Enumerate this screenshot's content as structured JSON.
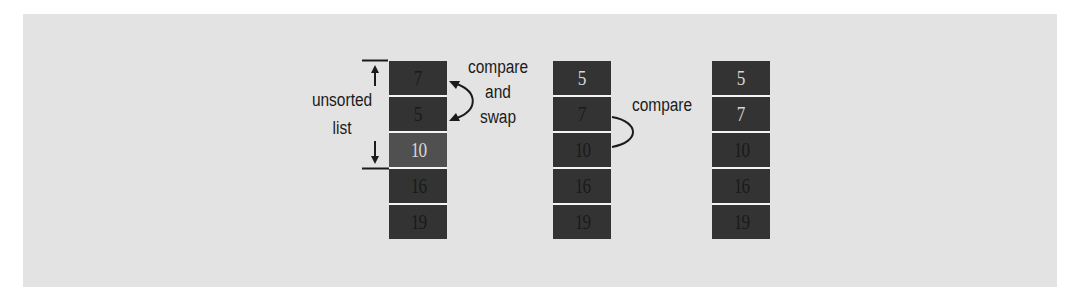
{
  "diagram": {
    "colors": {
      "panel_background": "#e3e3e3",
      "cell_fill": "#333333",
      "cell_fill_highlight": "#505050",
      "dark_number": "#1a1a1a",
      "light_number": "#d8d8d8",
      "line": "#1b1b1b"
    },
    "columns": [
      {
        "id": "step-1",
        "cells": [
          {
            "value": "7",
            "text_style": "dark",
            "fill": "dark"
          },
          {
            "value": "5",
            "text_style": "dark",
            "fill": "dark"
          },
          {
            "value": "10",
            "text_style": "light",
            "fill": "highlight"
          },
          {
            "value": "16",
            "text_style": "dark",
            "fill": "dark"
          },
          {
            "value": "19",
            "text_style": "dark",
            "fill": "dark"
          }
        ]
      },
      {
        "id": "step-2",
        "cells": [
          {
            "value": "5",
            "text_style": "light",
            "fill": "dark"
          },
          {
            "value": "7",
            "text_style": "dark",
            "fill": "dark"
          },
          {
            "value": "10",
            "text_style": "dark",
            "fill": "dark"
          },
          {
            "value": "16",
            "text_style": "dark",
            "fill": "dark"
          },
          {
            "value": "19",
            "text_style": "dark",
            "fill": "dark"
          }
        ]
      },
      {
        "id": "step-3",
        "cells": [
          {
            "value": "5",
            "text_style": "light",
            "fill": "dark"
          },
          {
            "value": "7",
            "text_style": "light",
            "fill": "dark"
          },
          {
            "value": "10",
            "text_style": "dark",
            "fill": "dark"
          },
          {
            "value": "16",
            "text_style": "dark",
            "fill": "dark"
          },
          {
            "value": "19",
            "text_style": "dark",
            "fill": "dark"
          }
        ]
      }
    ],
    "labels": {
      "unsorted_line1": "unsorted",
      "unsorted_line2": "list",
      "compare_swap_line1": "compare",
      "compare_swap_line2": "and",
      "compare_swap_line3": "swap",
      "compare": "compare"
    },
    "annotations": [
      {
        "type": "bracket-arrows",
        "name": "unsorted-list-range",
        "spans_cells": [
          0,
          2
        ],
        "column": 0
      },
      {
        "type": "double-arrow-curve",
        "name": "compare-and-swap",
        "between_cells": [
          0,
          1
        ],
        "column": 0
      },
      {
        "type": "curve",
        "name": "compare",
        "between_cells": [
          1,
          2
        ],
        "column": 1
      }
    ]
  }
}
